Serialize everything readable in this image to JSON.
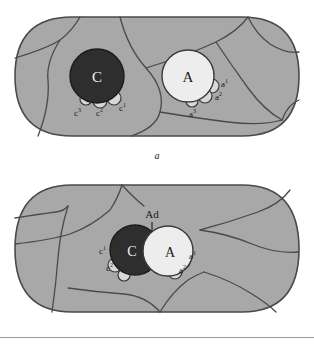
{
  "figure": {
    "panels": [
      {
        "id": "a",
        "caption": "a",
        "description": "Two tissue fields side by side; dark C cell at left with three buds, light A cell at right with three buds; C and A are separate",
        "cells": [
          {
            "name": "C",
            "label": "C",
            "type": "dark-cell",
            "fill": "#2e2e2e",
            "text_color": "#f2f2f2",
            "cx": 97,
            "cy": 76,
            "r": 27,
            "buds": [
              {
                "label": "c1",
                "base": "c",
                "superscript": "1",
                "cx": 114,
                "cy": 98,
                "r": 7
              },
              {
                "label": "c2",
                "base": "c",
                "superscript": "2",
                "cx": 100,
                "cy": 101,
                "r": 7
              },
              {
                "label": "c3",
                "base": "c",
                "superscript": "3",
                "cx": 86,
                "cy": 99,
                "r": 6
              }
            ]
          },
          {
            "name": "A",
            "label": "A",
            "type": "light-cell",
            "fill": "#ededed",
            "text_color": "#1a1a1a",
            "cx": 188,
            "cy": 76,
            "r": 26,
            "buds": [
              {
                "label": "a1",
                "base": "a",
                "superscript": "1",
                "cx": 212,
                "cy": 86,
                "r": 7
              },
              {
                "label": "a2",
                "base": "a",
                "superscript": "2",
                "cx": 205,
                "cy": 96,
                "r": 7
              },
              {
                "label": "a3",
                "base": "a",
                "superscript": "3",
                "cx": 192,
                "cy": 101,
                "r": 6
              }
            ]
          }
        ],
        "bud_labels": [
          {
            "text_base": "c",
            "sup": "3",
            "x": 78,
            "y": 115
          },
          {
            "text_base": "c",
            "sup": "2",
            "x": 100,
            "y": 115
          },
          {
            "text_base": "c",
            "sup": "1",
            "x": 122,
            "y": 110
          },
          {
            "text_base": "a",
            "sup": "1",
            "x": 224,
            "y": 86
          },
          {
            "text_base": "a",
            "sup": "2",
            "x": 218,
            "y": 99
          },
          {
            "text_base": "a",
            "sup": "3",
            "x": 193,
            "y": 116
          }
        ]
      },
      {
        "id": "b",
        "caption": "b",
        "description": "Single tissue field; dark C cell and light A cell adjoined at center with adhesion point labelled Ad; two buds on each cell",
        "adhesion_label": "Ad",
        "cells": [
          {
            "name": "C",
            "label": "C",
            "type": "dark-cell",
            "fill": "#2e2e2e",
            "text_color": "#f2f2f2",
            "cx": 135,
            "cy": 250,
            "r": 25,
            "buds": [
              {
                "label": "c1",
                "base": "c",
                "superscript": "1",
                "cx": 115,
                "cy": 265,
                "r": 7
              },
              {
                "label": "c2",
                "base": "c",
                "superscript": "2",
                "cx": 124,
                "cy": 275,
                "r": 6
              }
            ]
          },
          {
            "name": "A",
            "label": "A",
            "type": "light-cell",
            "fill": "#ededed",
            "text_color": "#1a1a1a",
            "cx": 168,
            "cy": 251,
            "r": 25,
            "buds": [
              {
                "label": "a1",
                "base": "a",
                "superscript": "1",
                "cx": 183,
                "cy": 262,
                "r": 7
              },
              {
                "label": "a2",
                "base": "a",
                "superscript": "2",
                "cx": 175,
                "cy": 272,
                "r": 7
              }
            ]
          }
        ],
        "bud_labels": [
          {
            "text_base": "c",
            "sup": "1",
            "x": 103,
            "y": 253
          },
          {
            "text_base": "c",
            "sup": "2",
            "x": 110,
            "y": 270
          },
          {
            "text_base": "a",
            "sup": "1",
            "x": 192,
            "y": 258
          },
          {
            "text_base": "a",
            "sup": "2",
            "x": 183,
            "y": 272
          }
        ]
      }
    ],
    "colors": {
      "tissue_fill": "#a8a8a8",
      "tissue_stroke": "#4a4a4a",
      "dark_cell": "#2e2e2e",
      "light_cell": "#ededed",
      "bud_fill": "#d8d8d8",
      "label_color": "#1a1a1a",
      "rule_color": "#9a9a9a",
      "background": "#ffffff"
    }
  }
}
